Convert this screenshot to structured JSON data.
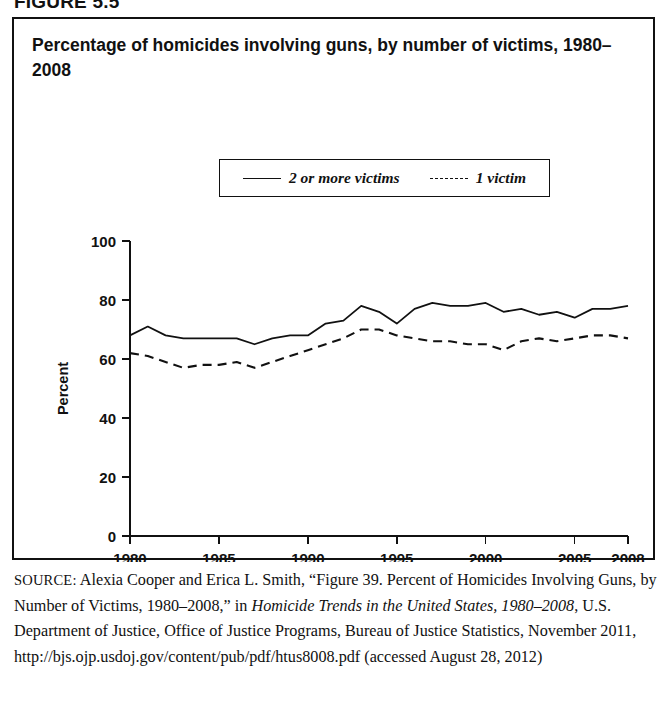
{
  "figure": {
    "number_label": "FIGURE 5.5"
  },
  "chart": {
    "title": "Percentage of homicides involving guns, by number of victims, 1980–2008",
    "ylabel": "Percent"
  },
  "legend": {
    "entries": [
      {
        "label": "2 or more victims",
        "style": "solid"
      },
      {
        "label": "1 victim",
        "style": "dashed"
      }
    ]
  },
  "source": {
    "label": "SOURCE:",
    "line1": " Alexia Cooper and Erica L. Smith, “Figure 39. Percent of",
    "line2": "Homicides Involving Guns, by Number of Victims, 1980–2008,” in ",
    "line3_italic": "Homicide Trends in the United States, 1980–2008",
    "line3_rest": ", U.S. Department of",
    "line4": "Justice, Office of Justice Programs, Bureau of Justice Statistics,",
    "line5": "November 2011, http://bjs.ojp.usdoj.gov/content/pub/pdf/htus8008.pdf",
    "line6": "(accessed August 28, 2012)"
  },
  "chart_data": {
    "type": "line",
    "title": "Percentage of homicides involving guns, by number of victims, 1980–2008",
    "xlabel": "",
    "ylabel": "Percent",
    "xlim": [
      1980,
      2008
    ],
    "ylim": [
      0,
      100
    ],
    "grid": false,
    "legend_position": "top-center",
    "x": [
      1980,
      1981,
      1982,
      1983,
      1984,
      1985,
      1986,
      1987,
      1988,
      1989,
      1990,
      1991,
      1992,
      1993,
      1994,
      1995,
      1996,
      1997,
      1998,
      1999,
      2000,
      2001,
      2002,
      2003,
      2004,
      2005,
      2006,
      2007,
      2008
    ],
    "x_ticks": [
      1980,
      1985,
      1990,
      1995,
      2000,
      2005,
      2008
    ],
    "x_tick_labels": [
      "1980",
      "1985",
      "1990",
      "1995",
      "2000",
      "2005",
      "2008"
    ],
    "y_ticks": [
      0,
      20,
      40,
      60,
      80,
      100
    ],
    "y_tick_labels": [
      "0",
      "20",
      "40",
      "60",
      "80",
      "100"
    ],
    "series": [
      {
        "name": "2 or more victims",
        "style": "solid",
        "values": [
          68,
          71,
          68,
          67,
          67,
          67,
          67,
          65,
          67,
          68,
          68,
          72,
          73,
          78,
          76,
          72,
          77,
          79,
          78,
          78,
          79,
          76,
          77,
          75,
          76,
          74,
          77,
          77,
          78
        ]
      },
      {
        "name": "1 victim",
        "style": "dashed",
        "values": [
          62,
          61,
          59,
          57,
          58,
          58,
          59,
          57,
          59,
          61,
          63,
          65,
          67,
          70,
          70,
          68,
          67,
          66,
          66,
          65,
          65,
          63,
          66,
          67,
          66,
          67,
          68,
          68,
          67
        ]
      }
    ]
  }
}
